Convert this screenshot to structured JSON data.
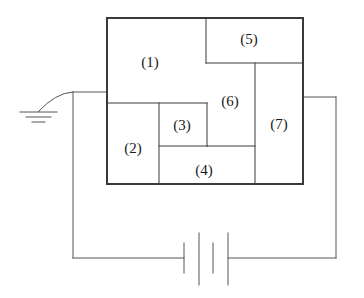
{
  "diagram": {
    "type": "circuit-schematic",
    "canvas": {
      "width": 364,
      "height": 298
    },
    "colors": {
      "stroke": "#555555",
      "box_stroke": "#3a3a3a",
      "label_text": "#1a1a1a",
      "background": "#ffffff"
    },
    "outer_box": {
      "name": "partitioned-box",
      "x": 107,
      "y": 18,
      "width": 196,
      "height": 166,
      "stroke_width": 2
    },
    "regions": [
      {
        "id": "1",
        "label": "(1)",
        "x": 107,
        "y": 18,
        "width": 99,
        "height": 85,
        "label_x": 150,
        "label_y": 62
      },
      {
        "id": "2",
        "label": "(2)",
        "x": 107,
        "y": 103,
        "width": 52,
        "height": 81,
        "label_x": 133,
        "label_y": 148
      },
      {
        "id": "3",
        "label": "(3)",
        "x": 159,
        "y": 103,
        "width": 48,
        "height": 43,
        "label_x": 182,
        "label_y": 125
      },
      {
        "id": "4",
        "label": "(4)",
        "x": 159,
        "y": 146,
        "width": 96,
        "height": 38,
        "label_x": 204,
        "label_y": 170
      },
      {
        "id": "5",
        "label": "(5)",
        "x": 206,
        "y": 18,
        "width": 97,
        "height": 45,
        "label_x": 249,
        "label_y": 39
      },
      {
        "id": "6",
        "label": "(6)",
        "x": 207,
        "y": 63,
        "width": 48,
        "height": 83,
        "label_x": 230,
        "label_y": 101
      },
      {
        "id": "7",
        "label": "(7)",
        "x": 255,
        "y": 63,
        "width": 48,
        "height": 121,
        "label_x": 279,
        "label_y": 124
      }
    ],
    "internal_lines": [
      {
        "name": "divider-1-bottom",
        "x1": 107,
        "y1": 103,
        "x2": 207,
        "y2": 103
      },
      {
        "name": "divider-1-5-vertical",
        "x1": 206,
        "y1": 18,
        "x2": 206,
        "y2": 63
      },
      {
        "name": "divider-5-bottom",
        "x1": 206,
        "y1": 63,
        "x2": 303,
        "y2": 63
      },
      {
        "name": "divider-6-7-vertical",
        "x1": 255,
        "y1": 63,
        "x2": 255,
        "y2": 184
      },
      {
        "name": "divider-6-bottom",
        "x1": 207,
        "y1": 146,
        "x2": 255,
        "y2": 146
      },
      {
        "name": "divider-2-3-vertical",
        "x1": 159,
        "y1": 103,
        "x2": 159,
        "y2": 184
      },
      {
        "name": "divider-3-right-vertical",
        "x1": 207,
        "y1": 103,
        "x2": 207,
        "y2": 146
      },
      {
        "name": "divider-3-4-horizontal",
        "x1": 159,
        "y1": 146,
        "x2": 207,
        "y2": 146
      }
    ],
    "ground": {
      "name": "ground-symbol",
      "lead_start_x": 73,
      "lead_start_y": 92,
      "lead_end_x": 38,
      "lead_end_y": 112,
      "bars": [
        {
          "x1": 20,
          "x2": 57,
          "y": 112
        },
        {
          "x1": 26,
          "x2": 51,
          "y": 117
        },
        {
          "x1": 32,
          "x2": 45,
          "y": 122
        }
      ]
    },
    "wires": {
      "left_top_horizontal": {
        "x1": 73,
        "y1": 92,
        "x2": 107,
        "y2": 92
      },
      "left_vertical": {
        "x1": 73,
        "y1": 92,
        "x2": 73,
        "y2": 258
      },
      "bottom_left_lead": {
        "x1": 73,
        "y1": 258,
        "x2": 184,
        "y2": 258
      },
      "bottom_right_lead": {
        "x1": 228,
        "y1": 258,
        "x2": 336,
        "y2": 258
      },
      "right_vertical": {
        "x1": 336,
        "y1": 97,
        "x2": 336,
        "y2": 258
      },
      "right_top_horizontal": {
        "x1": 303,
        "y1": 97,
        "x2": 336,
        "y2": 97
      }
    },
    "battery": {
      "name": "battery-symbol",
      "cells": 2,
      "plates": [
        {
          "x": 184,
          "y1": 243,
          "y2": 273,
          "kind": "short"
        },
        {
          "x": 199,
          "y1": 233,
          "y2": 285,
          "kind": "long"
        },
        {
          "x": 213,
          "y1": 243,
          "y2": 273,
          "kind": "short"
        },
        {
          "x": 228,
          "y1": 233,
          "y2": 285,
          "kind": "long"
        }
      ]
    }
  }
}
